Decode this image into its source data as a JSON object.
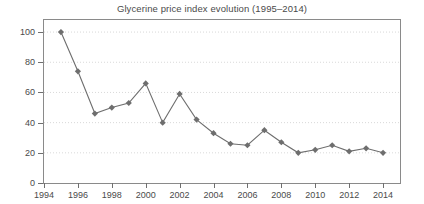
{
  "chart_data": {
    "type": "line",
    "title": "Glycerine price index evolution (1995–2014)",
    "xlabel": "",
    "ylabel": "",
    "x": [
      1995,
      1996,
      1997,
      1998,
      1999,
      2000,
      2001,
      2002,
      2003,
      2004,
      2005,
      2006,
      2007,
      2008,
      2009,
      2010,
      2011,
      2012,
      2013,
      2014
    ],
    "values": [
      100,
      74,
      46,
      50,
      53,
      66,
      40,
      59,
      42,
      33,
      26,
      25,
      35,
      27,
      20,
      22,
      25,
      21,
      23,
      20
    ],
    "series": [
      {
        "name": "Glycerine price index",
        "values": [
          100,
          74,
          46,
          50,
          53,
          66,
          40,
          59,
          42,
          33,
          26,
          25,
          35,
          27,
          20,
          22,
          25,
          21,
          23,
          20
        ]
      }
    ],
    "xlim": [
      1994,
      2015
    ],
    "ylim": [
      0,
      108
    ],
    "xticks": [
      1994,
      1996,
      1998,
      2000,
      2002,
      2004,
      2006,
      2008,
      2010,
      2012,
      2014
    ],
    "xtick_labels": [
      "1994",
      "1996",
      "1998",
      "2000",
      "2002",
      "2004",
      "2006",
      "2008",
      "2010",
      "2012",
      "2014"
    ],
    "yticks": [
      0,
      20,
      40,
      60,
      80,
      100
    ],
    "ytick_labels": [
      "0",
      "20",
      "40",
      "60",
      "80",
      "100"
    ],
    "grid": true,
    "grid_axis": "y",
    "grid_style": "dotted",
    "legend": false,
    "marker": "diamond",
    "line_color": "#6e6e6e",
    "marker_color": "#6e6e6e",
    "grid_color": "#d9d9d9",
    "axis_color": "#8a8a8a",
    "text_color": "#4a4a4a",
    "background": "#ffffff"
  }
}
